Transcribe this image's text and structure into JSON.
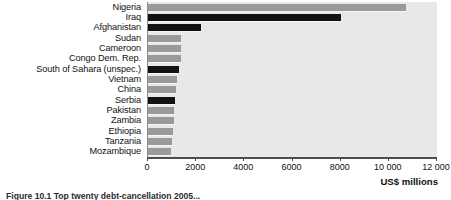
{
  "chart_data": {
    "type": "bar",
    "orientation": "horizontal",
    "title": "",
    "xlabel": "US$ millions",
    "ylabel": "",
    "xlim": [
      0,
      12000
    ],
    "xticks": [
      0,
      2000,
      4000,
      6000,
      8000,
      10000,
      12000
    ],
    "xtick_labels": [
      "0",
      "2000",
      "4000",
      "6000",
      "8000",
      "10 000",
      "12 000"
    ],
    "grid": false,
    "legend": null,
    "categories": [
      "Nigeria",
      "Iraq",
      "Afghanistan",
      "Sudan",
      "Cameroon",
      "Congo Dem. Rep.",
      "South of Sahara (unspec.)",
      "Vietnam",
      "China",
      "Serbia",
      "Pakistan",
      "Zambia",
      "Ethiopia",
      "Tanzania",
      "Mozambique"
    ],
    "values": [
      10700,
      8000,
      2200,
      1380,
      1380,
      1370,
      1300,
      1220,
      1150,
      1130,
      1100,
      1090,
      1020,
      1000,
      960
    ],
    "highlight": [
      false,
      true,
      true,
      false,
      false,
      false,
      true,
      false,
      false,
      true,
      false,
      false,
      false,
      false,
      false
    ],
    "colors": {
      "bar": "#9a9a9a",
      "bar_highlight": "#121212",
      "plot_background": "#e8e8e8",
      "axis": "#4d4d4d",
      "text": "#111111"
    }
  },
  "caption": {
    "text": "Figure 10.1  Top twenty debt-cancellation 2005..."
  }
}
